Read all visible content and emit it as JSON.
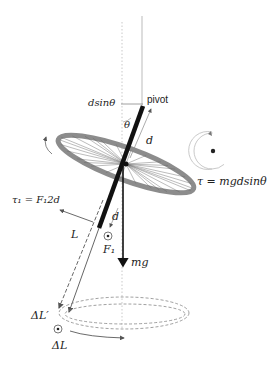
{
  "diagram": {
    "labels": {
      "pivot": "pivot",
      "dsintheta": "dsinθ",
      "theta": "θ",
      "d_upper": "d",
      "d_lower": "d",
      "torque": "τ = mgdsinθ",
      "tau1": "τ₁ = F₁2d",
      "L": "L",
      "F1": "F₁",
      "mg": "mg",
      "deltaLprime": "ΔL′",
      "deltaL": "ΔL"
    },
    "colors": {
      "axle": "#111111",
      "wheel_rim": "#8c8c8c",
      "spokes": "#555555",
      "guide_lines": "#b0b0b0",
      "arrows": "#555555",
      "text": "#222222"
    }
  }
}
